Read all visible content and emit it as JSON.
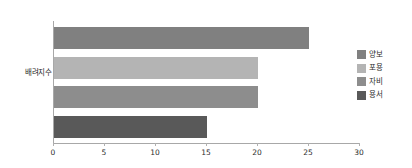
{
  "chart_data": {
    "type": "bar",
    "orientation": "horizontal",
    "title": "",
    "xlabel": "",
    "ylabel": "배려지수",
    "categories": [
      "배려지수"
    ],
    "xlim": [
      0,
      30
    ],
    "xticks": [
      0,
      5,
      10,
      15,
      20,
      25,
      30
    ],
    "xtick_labels": [
      "0",
      "5",
      "10",
      "15",
      "20",
      "25",
      "30"
    ],
    "grid": false,
    "legend_position": "right",
    "series": [
      {
        "name": "양보",
        "values": [
          25
        ],
        "color": "#808080"
      },
      {
        "name": "포용",
        "values": [
          20
        ],
        "color": "#b4b4b4"
      },
      {
        "name": "자비",
        "values": [
          20
        ],
        "color": "#8d8d8d"
      },
      {
        "name": "용서",
        "values": [
          15
        ],
        "color": "#595959"
      }
    ]
  },
  "axis": {
    "y_label": "배려지수",
    "line_color": "#a8a8a8",
    "tick_labels": [
      "0",
      "5",
      "10",
      "15",
      "20",
      "25",
      "30"
    ]
  },
  "legend": {
    "items": [
      {
        "label": "양보",
        "color": "#808080"
      },
      {
        "label": "포용",
        "color": "#b4b4b4"
      },
      {
        "label": "자비",
        "color": "#8d8d8d"
      },
      {
        "label": "용서",
        "color": "#595959"
      }
    ]
  },
  "bars": [
    {
      "label": "양보",
      "value": 25,
      "color": "#808080"
    },
    {
      "label": "포용",
      "value": 20,
      "color": "#b4b4b4"
    },
    {
      "label": "자비",
      "value": 20,
      "color": "#8d8d8d"
    },
    {
      "label": "용서",
      "value": 15,
      "color": "#595959"
    }
  ]
}
